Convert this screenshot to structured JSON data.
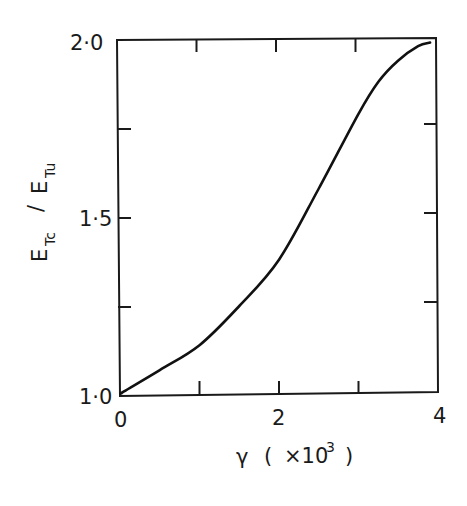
{
  "chart_data": {
    "type": "line",
    "title": "",
    "xlabel": "γ ( ×10³ )",
    "ylabel": "E_Tc / E_Tu",
    "xlim": [
      0,
      4
    ],
    "ylim": [
      1.0,
      2.0
    ],
    "grid": false,
    "legend": null,
    "x_ticks": [
      0,
      1,
      2,
      3,
      4
    ],
    "x_tick_labels": [
      "0",
      "",
      "2",
      "",
      "4"
    ],
    "y_ticks": [
      1.0,
      1.25,
      1.5,
      1.75,
      2.0
    ],
    "y_tick_labels": [
      "1·0",
      "",
      "1·5",
      "",
      "2·0"
    ],
    "series": [
      {
        "name": "E_Tc / E_Tu",
        "x": [
          0.05,
          0.5,
          1.0,
          1.5,
          2.0,
          2.5,
          3.0,
          3.25,
          3.5,
          3.75,
          3.9
        ],
        "y": [
          1.01,
          1.07,
          1.14,
          1.25,
          1.38,
          1.58,
          1.79,
          1.88,
          1.94,
          1.98,
          1.99
        ]
      }
    ]
  },
  "axes": {
    "x_label_main": "γ",
    "x_label_open": "(",
    "x_label_mult": "×10",
    "x_label_exp": "3",
    "x_label_close": ")",
    "y_label_E1": "E",
    "y_label_sub1": "Tc",
    "y_label_slash": "/",
    "y_label_E2": "E",
    "y_label_sub2": "Tu",
    "y_tick_top": "2·0",
    "y_tick_mid": "1·5",
    "y_tick_bottom": "1·0",
    "x_tick_left": "0",
    "x_tick_mid": "2",
    "x_tick_right": "4"
  },
  "colors": {
    "ink": "#1a1a1a",
    "background": "#ffffff"
  }
}
